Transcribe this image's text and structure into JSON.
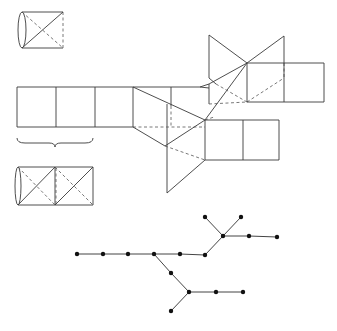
{
  "figure": {
    "stroke_color": "#3a3a3a",
    "node_color": "#111111"
  },
  "cylinder_single": {
    "box": [
      17,
      12,
      63,
      48
    ]
  },
  "cylinder_double": {
    "box": [
      17,
      167,
      93,
      205
    ]
  },
  "brace": {
    "x1": 17,
    "x2": 93,
    "y": 143
  },
  "tree": {
    "nodes": [
      {
        "id": 0,
        "x": 77,
        "y": 254
      },
      {
        "id": 1,
        "x": 103,
        "y": 254
      },
      {
        "id": 2,
        "x": 128,
        "y": 254
      },
      {
        "id": 3,
        "x": 154,
        "y": 254
      },
      {
        "id": 4,
        "x": 180,
        "y": 254
      },
      {
        "id": 5,
        "x": 205,
        "y": 255
      },
      {
        "id": 6,
        "x": 223,
        "y": 236
      },
      {
        "id": 7,
        "x": 205,
        "y": 217
      },
      {
        "id": 8,
        "x": 241,
        "y": 217
      },
      {
        "id": 9,
        "x": 249,
        "y": 236
      },
      {
        "id": 10,
        "x": 277,
        "y": 237
      },
      {
        "id": 11,
        "x": 171,
        "y": 273
      },
      {
        "id": 12,
        "x": 189,
        "y": 292
      },
      {
        "id": 13,
        "x": 171,
        "y": 311
      },
      {
        "id": 14,
        "x": 216,
        "y": 292
      },
      {
        "id": 15,
        "x": 243,
        "y": 292
      }
    ],
    "edges": [
      [
        0,
        1
      ],
      [
        1,
        2
      ],
      [
        2,
        3
      ],
      [
        3,
        4
      ],
      [
        4,
        5
      ],
      [
        5,
        6
      ],
      [
        6,
        7
      ],
      [
        6,
        8
      ],
      [
        6,
        9
      ],
      [
        9,
        10
      ],
      [
        3,
        11
      ],
      [
        11,
        12
      ],
      [
        12,
        13
      ],
      [
        12,
        14
      ],
      [
        14,
        15
      ]
    ]
  }
}
